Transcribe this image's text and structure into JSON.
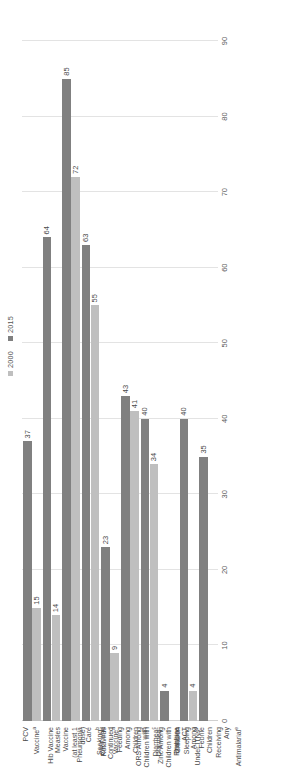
{
  "legend": {
    "position": "top-right",
    "items": [
      {
        "label": "2000",
        "color": "#bfbfbf"
      },
      {
        "label": "2015",
        "color": "#808080"
      }
    ]
  },
  "axis": {
    "ticks": [
      "0",
      "10",
      "20",
      "30",
      "40",
      "50",
      "60",
      "70",
      "80",
      "90"
    ],
    "min": 0,
    "max": 90,
    "step": 10
  },
  "colors": {
    "series_2000": "#bfbfbf",
    "series_2015": "#808080",
    "gridline": "#e3e3e3",
    "text": "#4a4a4a",
    "background": "#ffffff"
  },
  "categories": [
    {
      "label": "PCV Vaccine",
      "sup": "a"
    },
    {
      "label": "Hib Vaccine",
      "sup": ""
    },
    {
      "label": "Measles Vaccine\n(at least 1 dose)",
      "sup": ""
    },
    {
      "label": "Pneumonia Care\nSeeking",
      "sup": "b"
    },
    {
      "label": "Rotavirus\nVaccine",
      "sup": "a"
    },
    {
      "label": "ORT and\nContinued Feeding\nAmong Children\nwith Diarrhea",
      "sup": "c"
    },
    {
      "label": "ORS Among\nChildren with\nDiarrhea",
      "sup": "c"
    },
    {
      "label": "Zinc Among\nChildren with\nDiarrhea",
      "sup": ""
    },
    {
      "label": "Children Sleeping\nUnder ITNs",
      "sup": "d"
    },
    {
      "label": "First Line ACT\nAmong Febrile\nChildren Receiving\nAny\nAntimalarial",
      "sup": "e"
    }
  ],
  "bars": [
    {
      "cat": 0,
      "v2000": 15,
      "v2015": 37,
      "l2000": "15",
      "l2015": "37"
    },
    {
      "cat": 1,
      "v2000": 14,
      "v2015": 64,
      "l2000": "14",
      "l2015": "64"
    },
    {
      "cat": 2,
      "v2000": 72,
      "v2015": 85,
      "l2000": "72",
      "l2015": "85"
    },
    {
      "cat": 3,
      "v2000": 55,
      "v2015": 63,
      "l2000": "55",
      "l2015": "63"
    },
    {
      "cat": 4,
      "v2000": 9,
      "v2015": 23,
      "l2000": "9",
      "l2015": "23"
    },
    {
      "cat": 5,
      "v2000": 41,
      "v2015": 43,
      "l2000": "41",
      "l2015": "43"
    },
    {
      "cat": 6,
      "v2000": 34,
      "v2015": 40,
      "l2000": "34",
      "l2015": "40"
    },
    {
      "cat": 7,
      "v2000": null,
      "v2015": 4,
      "l2000": "",
      "l2015": "4"
    },
    {
      "cat": 8,
      "v2000": 4,
      "v2015": 40,
      "l2000": "4",
      "l2015": "40"
    },
    {
      "cat": 9,
      "v2000": null,
      "v2015": 35,
      "l2000": "",
      "l2015": "35"
    }
  ],
  "chart_data": {
    "type": "bar",
    "orientation": "horizontal",
    "title": "",
    "subtitle": "",
    "xlabel": "",
    "ylabel": "",
    "xlim": [
      0,
      90
    ],
    "grid": true,
    "legend_position": "top-right",
    "categories": [
      "PCV Vaccinea",
      "Hib Vaccine",
      "Measles Vaccine (at least 1 dose)",
      "Pneumonia Care Seekingb",
      "Rotavirus Vaccinea",
      "ORT and Continued Feeding Among Children with Diarrheac",
      "ORS Among Children with Diarrheac",
      "Zinc Among Children with Diarrhea",
      "Children Sleeping Under ITNsd",
      "First Line ACT Among Febrile Children Receiving Any Antimalariale"
    ],
    "series": [
      {
        "name": "2000",
        "color": "#bfbfbf",
        "values": [
          15,
          14,
          72,
          55,
          9,
          41,
          34,
          null,
          4,
          null
        ]
      },
      {
        "name": "2015",
        "color": "#808080",
        "values": [
          37,
          64,
          85,
          63,
          23,
          43,
          40,
          4,
          40,
          35
        ]
      }
    ],
    "tick_labels": [
      "0",
      "10",
      "20",
      "30",
      "40",
      "50",
      "60",
      "70",
      "80",
      "90"
    ],
    "data_labels_shown": true
  }
}
